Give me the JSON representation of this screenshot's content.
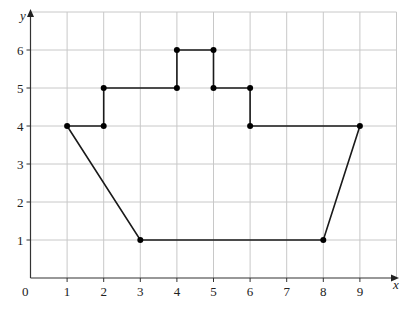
{
  "chart_data": {
    "type": "line",
    "title": "",
    "xlabel": "x",
    "ylabel": "y",
    "xlim": [
      0,
      10
    ],
    "ylim": [
      0,
      7
    ],
    "grid": true,
    "x_ticks": [
      "0",
      "1",
      "2",
      "3",
      "4",
      "5",
      "6",
      "7",
      "8",
      "9"
    ],
    "y_ticks": [
      "1",
      "2",
      "3",
      "4",
      "5",
      "6"
    ],
    "origin_label": "0",
    "series": [
      {
        "name": "closed polygon (ship shape)",
        "closed": true,
        "points": [
          [
            1,
            4
          ],
          [
            2,
            4
          ],
          [
            2,
            5
          ],
          [
            4,
            5
          ],
          [
            4,
            6
          ],
          [
            5,
            6
          ],
          [
            5,
            5
          ],
          [
            6,
            5
          ],
          [
            6,
            4
          ],
          [
            9,
            4
          ],
          [
            8,
            1
          ],
          [
            3,
            1
          ]
        ]
      }
    ],
    "colors": {
      "grid": "#c8c8c8",
      "axis": "#333333",
      "line": "#1a1a1a",
      "points": "#000000"
    }
  }
}
